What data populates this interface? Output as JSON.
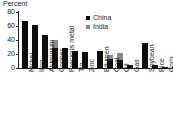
{
  "chart_data": {
    "type": "bar",
    "subtype": "stacked",
    "title": "Percent",
    "xlabel": "",
    "ylabel": "Percent",
    "ylim": [
      0,
      80
    ],
    "yticks": [
      0,
      20,
      40,
      60,
      80
    ],
    "grid": false,
    "legend_position": "top-right",
    "legend": [
      "China",
      "India"
    ],
    "colors": {
      "China": "#0d0d0d",
      "India": "#8a8a8a"
    },
    "groups": [
      {
        "name": "Metals",
        "categories": [
          "Nickel",
          "Iron",
          "Aluminium",
          "Copper",
          "Precious metal",
          "Tin",
          "Zinc"
        ]
      },
      {
        "name": "Energy",
        "categories": [
          "Bitumen",
          "Coal",
          "Oil",
          "Gas"
        ]
      },
      {
        "name": "Agriculture",
        "categories": [
          "Soybean",
          "Rice",
          "Corn",
          "Wheat"
        ]
      }
    ],
    "categories": [
      "Nickel",
      "Iron",
      "Aluminium",
      "Copper",
      "Precious metal",
      "Tin",
      "Zinc",
      "Bitumen",
      "Coal",
      "Oil",
      "Gas",
      "Soybean",
      "Rice",
      "Corn",
      "Wheat"
    ],
    "series": [
      {
        "name": "China",
        "values": [
          67,
          61,
          47,
          29,
          28,
          25,
          23,
          25,
          13,
          11,
          5,
          36,
          4,
          2,
          1.5
        ]
      },
      {
        "name": "India",
        "values": [
          0,
          0,
          0,
          11,
          0,
          0,
          0,
          0,
          6,
          10,
          0,
          0,
          0,
          0,
          0
        ]
      }
    ],
    "bars": [
      {
        "label": "Nickel",
        "china": 67,
        "india": 0,
        "x": 3
      },
      {
        "label": "Iron",
        "china": 61,
        "india": 0,
        "x": 13
      },
      {
        "label": "Aluminium",
        "china": 47,
        "india": 0,
        "x": 23
      },
      {
        "label": "Copper",
        "china": 29,
        "india": 11,
        "x": 33
      },
      {
        "label": "Precious metal",
        "china": 28,
        "india": 0,
        "x": 43
      },
      {
        "label": "Tin",
        "china": 25,
        "india": 0,
        "x": 53
      },
      {
        "label": "Zinc",
        "china": 23,
        "india": 0,
        "x": 63
      },
      {
        "label": "Bitumen",
        "china": 25,
        "india": 0,
        "x": 78
      },
      {
        "label": "Coal",
        "china": 13,
        "india": 6,
        "x": 88
      },
      {
        "label": "Oil",
        "china": 11,
        "india": 10,
        "x": 98
      },
      {
        "label": "Gas",
        "china": 5,
        "india": 0,
        "x": 108
      },
      {
        "label": "Soybean",
        "china": 36,
        "india": 0,
        "x": 123
      },
      {
        "label": "Rice",
        "china": 4,
        "india": 0,
        "x": 133
      },
      {
        "label": "Corn",
        "china": 2,
        "india": 0,
        "x": 143
      },
      {
        "label": "Wheat",
        "china": 1.5,
        "india": 0,
        "x": 153
      }
    ]
  }
}
